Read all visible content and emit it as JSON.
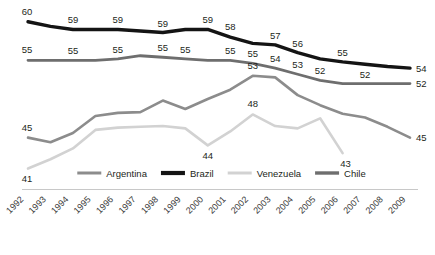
{
  "chart_data": {
    "type": "line",
    "title": "",
    "subtitle": "",
    "xlabel": "",
    "ylabel": "",
    "grid": false,
    "legend_position": "bottom",
    "x": [
      "1992",
      "1993",
      "1994",
      "1995",
      "1996",
      "1997",
      "1998",
      "1999",
      "2000",
      "2001",
      "2002",
      "2003",
      "2004",
      "2005",
      "2006",
      "2007",
      "2008",
      "2009"
    ],
    "xlim": [
      "1992",
      "2009"
    ],
    "ylim": [
      39,
      61
    ],
    "series": [
      {
        "name": "Argentina",
        "color": "#8c8c8c",
        "width": 2.6,
        "values": [
          45,
          44.4,
          45.6,
          47.8,
          48.2,
          48.3,
          49.8,
          48.7,
          50,
          51.2,
          53,
          52.8,
          50.5,
          49.2,
          48.1,
          47.6,
          46.4,
          45
        ],
        "labels": [
          {
            "x": "1992",
            "value": "45"
          },
          {
            "x": "2002",
            "value": "53"
          },
          {
            "x": "2009",
            "value": "45"
          }
        ]
      },
      {
        "name": "Brazil",
        "color": "#141414",
        "width": 3.4,
        "values": [
          60,
          59.4,
          59,
          59,
          59,
          58.8,
          58.6,
          59,
          59,
          58,
          57.2,
          57,
          56,
          55.2,
          54.8,
          54.5,
          54.2,
          54
        ],
        "labels": [
          {
            "x": "1992",
            "value": "60"
          },
          {
            "x": "1994",
            "value": "59"
          },
          {
            "x": "1996",
            "value": "59"
          },
          {
            "x": "1998",
            "value": "59"
          },
          {
            "x": "2000",
            "value": "59"
          },
          {
            "x": "2001",
            "value": "58"
          },
          {
            "x": "2003",
            "value": "57"
          },
          {
            "x": "2004",
            "value": "56"
          },
          {
            "x": "2006",
            "value": "55"
          },
          {
            "x": "2009",
            "value": "54"
          }
        ]
      },
      {
        "name": "Venezuela",
        "color": "#d2d2d2",
        "width": 2.6,
        "values": [
          41,
          42.2,
          43.6,
          46,
          46.3,
          46.4,
          46.5,
          46.2,
          44,
          45.8,
          48,
          46.5,
          46.2,
          47.5,
          43,
          null,
          null,
          null
        ],
        "labels": [
          {
            "x": "1992",
            "value": "41"
          },
          {
            "x": "2000",
            "value": "44"
          },
          {
            "x": "2002",
            "value": "48"
          },
          {
            "x": "2006",
            "value": "43"
          }
        ]
      },
      {
        "name": "Chile",
        "color": "#6e6e6e",
        "width": 2.8,
        "values": [
          55,
          55,
          55,
          55,
          55.2,
          55.6,
          55.4,
          55.2,
          55,
          55,
          54.6,
          54,
          53.2,
          52.4,
          52,
          52,
          52,
          52
        ],
        "labels": [
          {
            "x": "1992",
            "value": "55"
          },
          {
            "x": "1994",
            "value": "55"
          },
          {
            "x": "1996",
            "value": "55"
          },
          {
            "x": "1998",
            "value": "55"
          },
          {
            "x": "1999",
            "value": "55"
          },
          {
            "x": "2001",
            "value": "55"
          },
          {
            "x": "2002",
            "value": "55"
          },
          {
            "x": "2003",
            "value": "54"
          },
          {
            "x": "2004",
            "value": "53"
          },
          {
            "x": "2005",
            "value": "52"
          },
          {
            "x": "2007",
            "value": "52"
          },
          {
            "x": "2009",
            "value": "52"
          }
        ]
      }
    ],
    "legend": [
      {
        "label": "Argentina",
        "color": "#8c8c8c",
        "width": 3
      },
      {
        "label": "Brazil",
        "color": "#141414",
        "width": 4.2
      },
      {
        "label": "Venezuela",
        "color": "#d2d2d2",
        "width": 3
      },
      {
        "label": "Chile",
        "color": "#6e6e6e",
        "width": 3.4
      }
    ]
  }
}
